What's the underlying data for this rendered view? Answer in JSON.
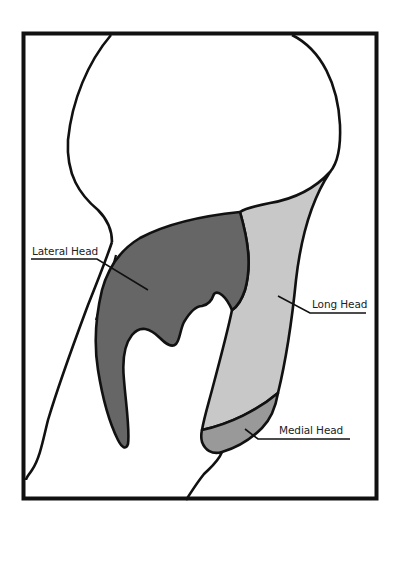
{
  "diagram": {
    "colors": {
      "lateral_head": "#666666",
      "long_head": "#c8c8c8",
      "medial_head": "#999999",
      "outline": "#111111",
      "background": "#ffffff"
    },
    "labels": {
      "lateral_head": "Lateral Head",
      "long_head": "Long Head",
      "medial_head": "Medial Head"
    }
  }
}
